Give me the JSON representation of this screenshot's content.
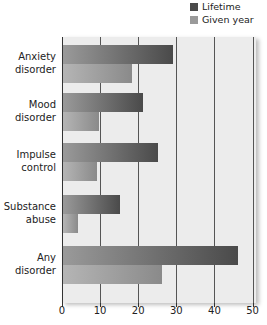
{
  "legend": {
    "lifetime": {
      "label": "Lifetime",
      "color": "#4a4a4a"
    },
    "year": {
      "label": "Given year",
      "color": "#9a9a9a"
    }
  },
  "categories": [
    {
      "l1": "Anxiety",
      "l2": "disorder"
    },
    {
      "l1": "Mood",
      "l2": "disorder"
    },
    {
      "l1": "Impulse",
      "l2": "control"
    },
    {
      "l1": "Substance",
      "l2": "abuse"
    },
    {
      "l1": "Any",
      "l2": "disorder"
    }
  ],
  "ticks": [
    "0",
    "10",
    "20",
    "30",
    "40",
    "50"
  ],
  "chart_data": {
    "type": "bar",
    "orientation": "horizontal",
    "categories": [
      "Anxiety disorder",
      "Mood disorder",
      "Impulse control",
      "Substance abuse",
      "Any disorder"
    ],
    "series": [
      {
        "name": "Lifetime",
        "values": [
          29,
          21,
          25,
          15,
          46
        ]
      },
      {
        "name": "Given year",
        "values": [
          18,
          9.5,
          9,
          4,
          26
        ]
      }
    ],
    "title": "",
    "xlabel": "",
    "ylabel": "",
    "xlim": [
      0,
      50
    ],
    "xticks": [
      0,
      10,
      20,
      30,
      40,
      50
    ],
    "grid": "vertical",
    "legend_position": "top-right"
  }
}
